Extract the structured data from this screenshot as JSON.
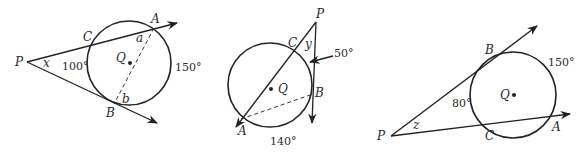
{
  "figures": [
    {
      "id": "fig1",
      "labels": {
        "P": "P",
        "C": "C",
        "A": "A",
        "B": "B",
        "Q": "Q",
        "x": "x",
        "a": "a",
        "b": "b"
      },
      "arcs": {
        "minor_CB": "100°",
        "major_AB": "150°"
      }
    },
    {
      "id": "fig2",
      "labels": {
        "P": "P",
        "C": "C",
        "A": "A",
        "B": "B",
        "Q": "Q",
        "y": "y"
      },
      "arcs": {
        "CB": "50°",
        "AB": "140°"
      }
    },
    {
      "id": "fig3",
      "labels": {
        "P": "P",
        "C": "C",
        "A": "A",
        "B": "B",
        "Q": "Q",
        "z": "z"
      },
      "arcs": {
        "BC": "80°",
        "BA": "150°"
      }
    }
  ]
}
